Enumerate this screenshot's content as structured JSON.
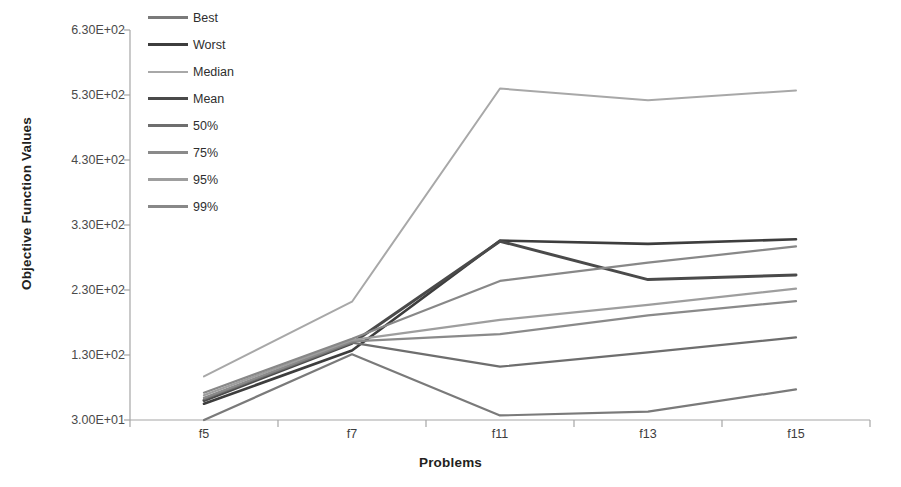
{
  "chart_data": {
    "type": "line",
    "title": "",
    "xlabel": "Problems",
    "ylabel": "Objective Function Values",
    "categories": [
      "f5",
      "f7",
      "f11",
      "f13",
      "f15"
    ],
    "ytick_labels": [
      "3.00E+01",
      "1.30E+02",
      "2.30E+02",
      "3.30E+02",
      "4.30E+02",
      "5.30E+02",
      "6.30E+02"
    ],
    "ytick_values": [
      30,
      130,
      230,
      330,
      430,
      530,
      630
    ],
    "ylim": [
      30,
      630
    ],
    "grid": false,
    "legend_position": "top-left-inside",
    "series": [
      {
        "name": "Best",
        "color": "#7a7a7a",
        "width": 2.2,
        "values": [
          30,
          131,
          37,
          43,
          77
        ]
      },
      {
        "name": "Worst",
        "color": "#3d3d3d",
        "width": 2.6,
        "values": [
          55,
          137,
          306,
          301,
          308
        ]
      },
      {
        "name": "Median",
        "color": "#a8a8a8",
        "width": 2.0,
        "values": [
          97,
          212,
          540,
          522,
          537
        ]
      },
      {
        "name": "Mean",
        "color": "#4a4a4a",
        "width": 3.0,
        "values": [
          60,
          148,
          305,
          246,
          253
        ]
      },
      {
        "name": "50%",
        "color": "#6e6e6e",
        "width": 2.2,
        "values": [
          62,
          149,
          112,
          134,
          157
        ]
      },
      {
        "name": "75%",
        "color": "#8a8a8a",
        "width": 2.2,
        "values": [
          64,
          151,
          162,
          191,
          213
        ]
      },
      {
        "name": "95%",
        "color": "#9e9e9e",
        "width": 2.2,
        "values": [
          68,
          153,
          184,
          207,
          232
        ]
      },
      {
        "name": "99%",
        "color": "#888888",
        "width": 2.2,
        "values": [
          72,
          155,
          244,
          272,
          297
        ]
      }
    ]
  },
  "axis": {
    "x_label": "Problems",
    "y_label": "Objective Function Values"
  },
  "legend": {
    "items": [
      {
        "label": "Best"
      },
      {
        "label": "Worst"
      },
      {
        "label": "Median"
      },
      {
        "label": "Mean"
      },
      {
        "label": "50%"
      },
      {
        "label": "75%"
      },
      {
        "label": "95%"
      },
      {
        "label": "99%"
      }
    ]
  },
  "colors": {
    "axis_line": "#a6a6a6",
    "text": "#231f20",
    "background": "#ffffff"
  }
}
